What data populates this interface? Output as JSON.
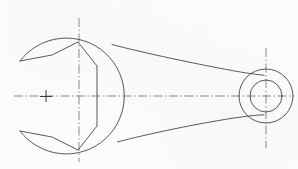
{
  "document": {
    "title": "Open-End Wrench Orthographic View",
    "drawing_type": "engineering-line-drawing",
    "view": "front-plan-view",
    "subject": "open-end-wrench",
    "background_color": "#fcfcfa",
    "line_color": "#3c3c3c",
    "centerline_color": "#555555",
    "canvas": {
      "width": 298,
      "height": 169
    }
  },
  "geometry": {
    "head": {
      "name": "wrench-head-circle",
      "center_x": 78,
      "center_y": 96,
      "radius": 58,
      "jaw_opening_angle_deg": 62,
      "description": "Large circular boss forming the wrench head, broken open on the left side to form the jaw mouth"
    },
    "jaw": {
      "name": "hex-jaw-profile",
      "opening_width": 46,
      "throat_x": 97,
      "mouth_x": 20,
      "vertices": [
        [
          20,
          61
        ],
        [
          52,
          55
        ],
        [
          78,
          42
        ],
        [
          97,
          66
        ],
        [
          97,
          126
        ],
        [
          78,
          150
        ],
        [
          52,
          137
        ],
        [
          20,
          131
        ]
      ],
      "description": "Hexagonal open-end jaw profile with flats engaging the fastener"
    },
    "handle": {
      "name": "tapered-handle",
      "top_start": [
        112,
        44
      ],
      "top_end": [
        262,
        74
      ],
      "bottom_start": [
        117,
        142
      ],
      "bottom_end": [
        262,
        119
      ],
      "taper": "narrowing toward the ring end"
    },
    "ring": {
      "name": "ring-end-boss",
      "center_x": 266,
      "center_y": 96,
      "outer_radius": 27,
      "inner_radius": 16,
      "description": "Annular boss at the handle tail with a through hole"
    },
    "centerlines": [
      {
        "name": "horizontal-axis-centerline",
        "orientation": "horizontal",
        "from": [
          14,
          96
        ],
        "to": [
          292,
          96
        ]
      },
      {
        "name": "head-vertical-centerline",
        "orientation": "vertical",
        "from": [
          79,
          18
        ],
        "to": [
          79,
          162
        ]
      },
      {
        "name": "ring-vertical-centerline",
        "orientation": "vertical",
        "from": [
          266,
          48
        ],
        "to": [
          266,
          148
        ]
      }
    ],
    "marks": [
      {
        "name": "reference-cross-mark",
        "x": 46,
        "y": 96,
        "arm_length": 6,
        "description": "Small plus datum/reference tick on the horizontal centerline"
      }
    ]
  },
  "style": {
    "outline_stroke_width": 0.85,
    "centerline_stroke_width": 0.7,
    "centerline_dash": "9 2.5 1.5 2.5",
    "mark_stroke_width": 1.0
  }
}
